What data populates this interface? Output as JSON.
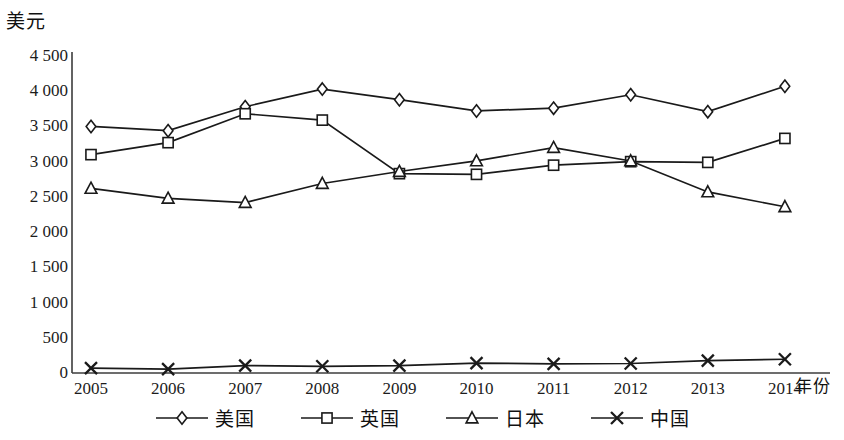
{
  "chart_data": {
    "type": "line",
    "title": "",
    "subtitle": "",
    "ylabel": "美元",
    "xlabel": "年份",
    "x": [
      2005,
      2006,
      2007,
      2008,
      2009,
      2010,
      2011,
      2012,
      2013,
      2014
    ],
    "categories": [
      "2005",
      "2006",
      "2007",
      "2008",
      "2009",
      "2010",
      "2011",
      "2012",
      "2013",
      "2014"
    ],
    "ylim": [
      0,
      4500
    ],
    "ytick_labels": [
      "4 500",
      "4 000",
      "3 500",
      "3 000",
      "2 500",
      "2 000",
      "1 500",
      "1 000",
      "500",
      "0"
    ],
    "ytick_values": [
      4500,
      4000,
      3500,
      3000,
      2500,
      2000,
      1500,
      1000,
      500,
      0
    ],
    "grid": false,
    "legend_position": "bottom",
    "series": [
      {
        "name": "美国",
        "marker": "diamond",
        "values": [
          3500,
          3440,
          3780,
          4030,
          3880,
          3720,
          3760,
          3950,
          3710,
          4070
        ]
      },
      {
        "name": "英国",
        "marker": "square",
        "values": [
          3100,
          3270,
          3680,
          3590,
          2830,
          2820,
          2950,
          3000,
          2990,
          3330
        ]
      },
      {
        "name": "日本",
        "marker": "triangle",
        "values": [
          2620,
          2480,
          2420,
          2690,
          2860,
          3010,
          3200,
          3010,
          2570,
          2360
        ]
      },
      {
        "name": "中国",
        "marker": "cross",
        "values": [
          70,
          55,
          105,
          95,
          105,
          140,
          130,
          135,
          175,
          195
        ]
      }
    ]
  },
  "style": {
    "line_color": "#1a1a1a",
    "axis_color": "#444444",
    "background": "#ffffff"
  }
}
